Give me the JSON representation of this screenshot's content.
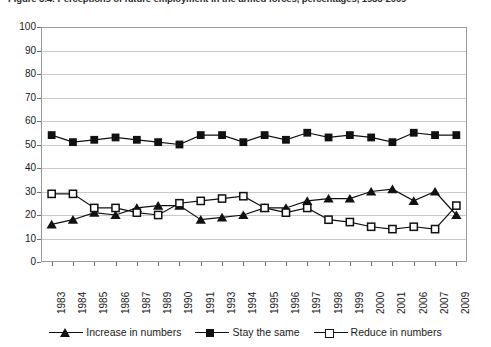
{
  "figure": {
    "caption": "Figure 3.4: Perceptions of future employment in the armed forces, percentages, 1983-2009"
  },
  "chart_data": {
    "type": "line",
    "title": "",
    "xlabel": "",
    "ylabel": "",
    "ylim": [
      0,
      100
    ],
    "ytick_step": 10,
    "yticks": [
      0,
      10,
      20,
      30,
      40,
      50,
      60,
      70,
      80,
      90,
      100
    ],
    "grid": true,
    "legend_position": "bottom",
    "categories": [
      "1983",
      "1984",
      "1985",
      "1986",
      "1987",
      "1989",
      "1990",
      "1991",
      "1993",
      "1994",
      "1995",
      "1996",
      "1997",
      "1998",
      "1999",
      "2000",
      "2001",
      "2006",
      "2007",
      "2009"
    ],
    "series": [
      {
        "name": "Increase in numbers",
        "marker": "filled-triangle",
        "values": [
          16,
          18,
          21,
          20,
          23,
          24,
          24,
          18,
          19,
          20,
          23,
          23,
          26,
          27,
          27,
          30,
          31,
          26,
          30,
          20
        ]
      },
      {
        "name": "Stay the same",
        "marker": "filled-square",
        "values": [
          54,
          51,
          52,
          53,
          52,
          51,
          50,
          54,
          54,
          51,
          54,
          52,
          55,
          53,
          54,
          53,
          51,
          55,
          54,
          54
        ]
      },
      {
        "name": "Reduce in numbers",
        "marker": "open-square",
        "values": [
          29,
          29,
          23,
          23,
          21,
          20,
          25,
          26,
          27,
          28,
          23,
          21,
          23,
          18,
          17,
          15,
          14,
          15,
          14,
          24
        ]
      }
    ]
  },
  "legend": {
    "items": [
      {
        "label": "Increase in numbers",
        "marker": "filled-triangle"
      },
      {
        "label": "Stay the same",
        "marker": "filled-square"
      },
      {
        "label": "Reduce in numbers",
        "marker": "open-square"
      }
    ]
  },
  "colors": {
    "series": "#111111",
    "gridline": "#c9c9c9",
    "axis": "#9a9a9a",
    "text": "#1a1a1a",
    "background": "#ffffff"
  }
}
